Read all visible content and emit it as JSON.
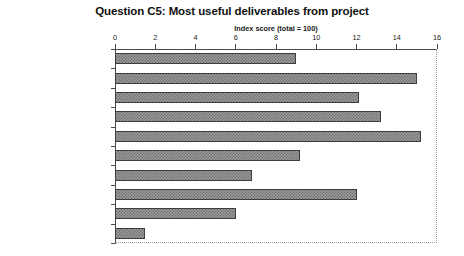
{
  "chart_data": {
    "type": "bar",
    "orientation": "horizontal",
    "title": "Question C5: Most useful deliverables from project",
    "subtitle": "Index score (total = 100)",
    "xlabel": "Index score (total = 100)",
    "ylabel": "",
    "xlim": [
      0,
      16
    ],
    "xticks": [
      0,
      2,
      4,
      6,
      8,
      10,
      12,
      14,
      16
    ],
    "xtick_labels": [
      "0",
      "2",
      "4",
      "6",
      "8",
      "10",
      "12",
      "14",
      "16"
    ],
    "grid": false,
    "legend": false,
    "axis_position": "top",
    "categories": [
      "Written reports",
      "Summary reports e.g. bullets",
      "Numerical analyses, etc",
      "Action plans/checklists",
      "Verbal presentations to you",
      "Verbal pres. to superiors",
      "Verbal pres. to staff",
      "Workshops",
      "The process itself",
      "Other"
    ],
    "values": [
      9,
      15,
      12.1,
      13.2,
      15.2,
      9.2,
      6.8,
      12,
      6,
      1.5
    ],
    "bar_fill_color": "#9b9b9b",
    "bar_pattern_color": "#6e6e6e",
    "bar_border_color": "#3d3d3d",
    "axis_color": "#4a4a4a",
    "plot_border_color": "#9a9a9a",
    "text_color": "#1a1a1a"
  }
}
